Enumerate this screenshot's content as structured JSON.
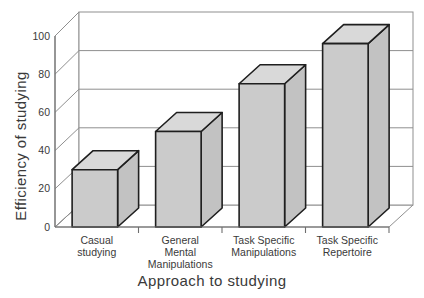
{
  "chart_data": {
    "type": "bar",
    "projection": "3d",
    "title": "",
    "xlabel": "Approach to studying",
    "ylabel": "Efficiency of studying",
    "categories": [
      [
        "Casual",
        "studying"
      ],
      [
        "General",
        "Mental",
        "Manipulations"
      ],
      [
        "Task Specific",
        "Manipulations"
      ],
      [
        "Task Specific",
        "Repertoire"
      ]
    ],
    "values": [
      30,
      50,
      75,
      96
    ],
    "ylim": [
      0,
      100
    ],
    "ytick_step": 20,
    "ytick_labels": [
      "0",
      "20",
      "40",
      "60",
      "80",
      "100"
    ],
    "grid": true,
    "legend": "none",
    "colors": {
      "bar_front": "#cbcbcb",
      "bar_top": "#d9d9d9",
      "bar_side": "#c2c2c2",
      "bar_outline": "#1f1f1f",
      "grid_line": "#8f8f8f",
      "frame_line": "#6e6e6e",
      "text": "#3a3a3a",
      "wall_fill": "#ffffff",
      "background": "#ffffff"
    },
    "tick_font_px": 10.5,
    "category_font_px": 10.5
  }
}
